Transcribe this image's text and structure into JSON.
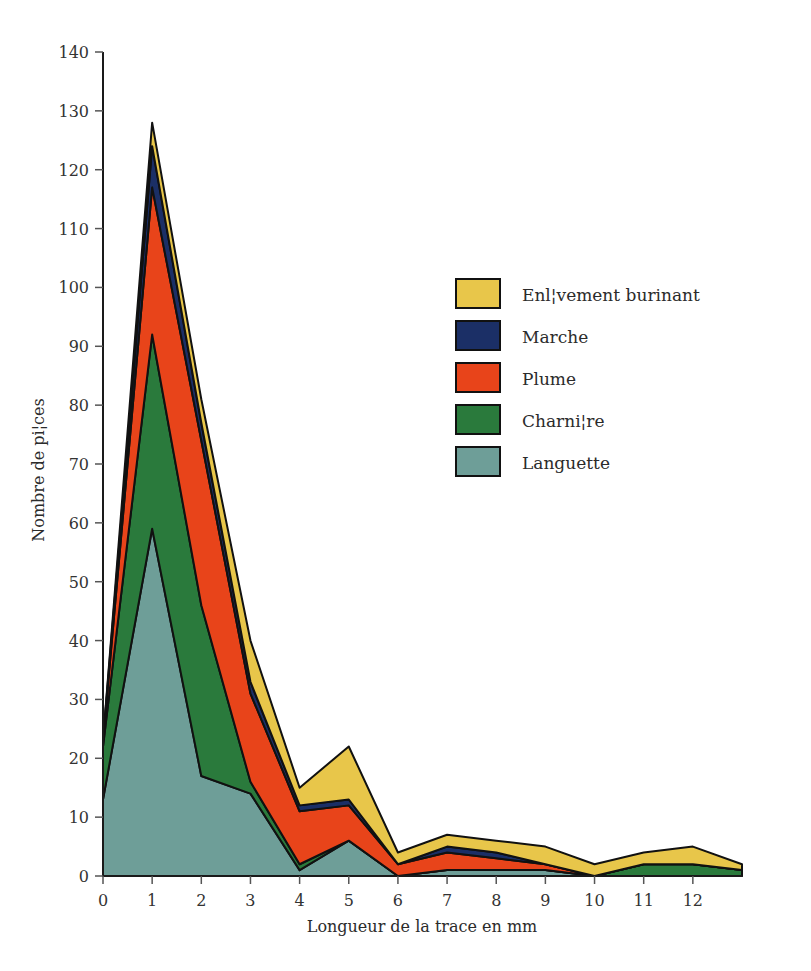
{
  "chart_data": {
    "type": "area",
    "stacked": true,
    "title": "",
    "subtitle": "",
    "xlabel": "Longueur de la trace en mm",
    "ylabel": "Nombre de pi¦ces",
    "xlim": [
      0,
      13
    ],
    "ylim": [
      0,
      140
    ],
    "xticks": [
      0,
      1,
      2,
      3,
      4,
      5,
      6,
      7,
      8,
      9,
      10,
      11,
      12
    ],
    "xtick_labels": [
      "0",
      "1",
      "2",
      "3",
      "4",
      "5",
      "6",
      "7",
      "8",
      "9",
      "10",
      "11",
      "12"
    ],
    "yticks": [
      0,
      10,
      20,
      30,
      40,
      50,
      60,
      70,
      80,
      90,
      100,
      110,
      120,
      130,
      140
    ],
    "ytick_labels": [
      "0",
      "10",
      "20",
      "30",
      "40",
      "50",
      "60",
      "70",
      "80",
      "90",
      "100",
      "110",
      "120",
      "130",
      "140"
    ],
    "grid": false,
    "legend_position": "inside-upper-right",
    "x": [
      0,
      1,
      2,
      3,
      4,
      5,
      6,
      7,
      8,
      9,
      10,
      11,
      12,
      13
    ],
    "series": [
      {
        "name": "Languette",
        "color": "#6E9E98",
        "stack_order": 1,
        "values": [
          13,
          59,
          17,
          14,
          1,
          6,
          0,
          1,
          1,
          1,
          0,
          0,
          0,
          0
        ]
      },
      {
        "name": "Charni¦re",
        "color": "#2A7A3C",
        "stack_order": 2,
        "values": [
          9,
          33,
          29,
          2,
          1,
          0,
          0,
          0,
          0,
          0,
          0,
          2,
          2,
          1
        ]
      },
      {
        "name": "Plume",
        "color": "#E8441A",
        "stack_order": 3,
        "values": [
          1,
          25,
          28,
          15,
          9,
          6,
          2,
          3,
          2,
          1,
          0,
          0,
          0,
          0
        ]
      },
      {
        "name": "Marche",
        "color": "#1B2F66",
        "stack_order": 4,
        "values": [
          0,
          7,
          3,
          2,
          1,
          1,
          0,
          1,
          1,
          0,
          0,
          0,
          0,
          0
        ]
      },
      {
        "name": "Enl¦vement burinant",
        "color": "#E8C64A",
        "stack_order": 5,
        "values": [
          0,
          4,
          4,
          7,
          3,
          9,
          2,
          2,
          2,
          3,
          2,
          2,
          3,
          1
        ]
      }
    ],
    "stack_totals": [
      23,
      128,
      81,
      40,
      15,
      22,
      4,
      7,
      6,
      5,
      2,
      4,
      5,
      2
    ],
    "outline_color": "#111111"
  },
  "legend": {
    "items": [
      {
        "label": "Enl¦vement burinant",
        "color": "#E8C64A"
      },
      {
        "label": "Marche",
        "color": "#1B2F66"
      },
      {
        "label": "Plume",
        "color": "#E8441A"
      },
      {
        "label": "Charni¦re",
        "color": "#2A7A3C"
      },
      {
        "label": "Languette",
        "color": "#6E9E98"
      }
    ]
  },
  "axes": {
    "x_title": "Longueur de la trace en mm",
    "y_title": "Nombre de pi¦ces"
  }
}
